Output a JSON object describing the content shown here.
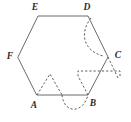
{
  "figure": {
    "canvas": {
      "width": 131,
      "height": 122
    },
    "colors": {
      "background": "#ffffff",
      "solid_stroke": "#6b6b6b",
      "dashed_stroke": "#5d5d5d",
      "label_text": "#2b2b2b"
    },
    "vertices": [
      {
        "name": "A",
        "label": "A",
        "x": 37,
        "y": 95,
        "label_x": 34,
        "label_y": 106
      },
      {
        "name": "B",
        "label": "B",
        "x": 88,
        "y": 95,
        "label_x": 93,
        "label_y": 104
      },
      {
        "name": "C",
        "label": "C",
        "x": 108,
        "y": 57,
        "label_x": 118,
        "label_y": 56
      },
      {
        "name": "D",
        "label": "D",
        "x": 88,
        "y": 16,
        "label_x": 87,
        "label_y": 8
      },
      {
        "name": "E",
        "label": "E",
        "x": 38,
        "y": 16,
        "label_x": 35,
        "label_y": 8
      },
      {
        "name": "F",
        "label": "F",
        "x": 18,
        "y": 57,
        "label_x": 10,
        "label_y": 57
      }
    ],
    "solid_edges": [
      {
        "name": "edge-AB",
        "from": "A",
        "to": "B"
      },
      {
        "name": "edge-BC",
        "from": "B",
        "to": "C"
      },
      {
        "name": "edge-CD",
        "from": "C",
        "to": "D"
      },
      {
        "name": "edge-DE",
        "from": "D",
        "to": "E"
      },
      {
        "name": "edge-EF",
        "from": "E",
        "to": "F"
      },
      {
        "name": "edge-FA",
        "from": "F",
        "to": "A"
      }
    ],
    "dashed_overlays": [
      {
        "name": "dashed-peak-above-A",
        "kind": "polyline",
        "d": "M 37 95 L 50 74 L 62 95"
      },
      {
        "name": "dashed-arc-below-AB",
        "kind": "arc",
        "d": "M 62 95 C 64 114 83 114 88 95"
      },
      {
        "name": "dashed-rect-right-of-B",
        "kind": "polyline",
        "d": "M 88 95 L 78 76 L 78 71 L 120 71 L 120 78"
      },
      {
        "name": "dashed-triangle-at-C",
        "kind": "polyline",
        "d": "M 108 57 L 118 78 L 120 78"
      },
      {
        "name": "dashed-arc-D-to-C",
        "kind": "arc",
        "d": "M 91 18 C 80 32 82 50 103 56"
      }
    ]
  }
}
